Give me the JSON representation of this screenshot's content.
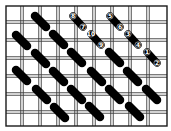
{
  "diagram": {
    "colors": {
      "background": "#ffffff",
      "grid_line": "#3a3a3a",
      "border": "#1a1a1a",
      "stitch": "#000000",
      "number": "#ffffff"
    },
    "grid": {
      "left": 6,
      "top": 6,
      "right": 167,
      "bottom": 126,
      "columns_x": [
        22,
        40,
        58,
        76,
        94,
        112,
        130,
        148
      ],
      "rows_y": [
        22,
        40,
        58,
        76,
        94,
        112
      ],
      "thread_gap": 2.5
    },
    "stitches": [
      {
        "x1": 35,
        "y1": 16,
        "x2": 46,
        "y2": 27
      },
      {
        "x1": 53,
        "y1": 34,
        "x2": 64,
        "y2": 45
      },
      {
        "x1": 71,
        "y1": 52,
        "x2": 82,
        "y2": 63
      },
      {
        "x1": 91,
        "y1": 71,
        "x2": 102,
        "y2": 82
      },
      {
        "x1": 109,
        "y1": 89,
        "x2": 120,
        "y2": 100
      },
      {
        "x1": 129,
        "y1": 106,
        "x2": 140,
        "y2": 117
      },
      {
        "x1": 16,
        "y1": 35,
        "x2": 27,
        "y2": 46
      },
      {
        "x1": 35,
        "y1": 53,
        "x2": 46,
        "y2": 64
      },
      {
        "x1": 53,
        "y1": 71,
        "x2": 64,
        "y2": 82
      },
      {
        "x1": 71,
        "y1": 89,
        "x2": 82,
        "y2": 100
      },
      {
        "x1": 89,
        "y1": 106,
        "x2": 100,
        "y2": 117
      },
      {
        "x1": 16,
        "y1": 70,
        "x2": 27,
        "y2": 81
      },
      {
        "x1": 36,
        "y1": 89,
        "x2": 47,
        "y2": 100
      },
      {
        "x1": 54,
        "y1": 107,
        "x2": 65,
        "y2": 118
      },
      {
        "x1": 109,
        "y1": 52,
        "x2": 120,
        "y2": 63
      },
      {
        "x1": 127,
        "y1": 71,
        "x2": 138,
        "y2": 82
      },
      {
        "x1": 146,
        "y1": 89,
        "x2": 157,
        "y2": 100
      }
    ],
    "numbered_stitches": [
      {
        "x1": 73,
        "y1": 16,
        "x2": 83,
        "y2": 27,
        "start": "8",
        "end": "7"
      },
      {
        "x1": 91,
        "y1": 34,
        "x2": 101,
        "y2": 45,
        "start": "10",
        "end": "9"
      },
      {
        "x1": 110,
        "y1": 16,
        "x2": 120,
        "y2": 27,
        "start": "5",
        "end": "6"
      },
      {
        "x1": 128,
        "y1": 34,
        "x2": 138,
        "y2": 45,
        "start": "3",
        "end": "4"
      },
      {
        "x1": 147,
        "y1": 52,
        "x2": 157,
        "y2": 63,
        "start": "1",
        "end": "2"
      }
    ]
  }
}
